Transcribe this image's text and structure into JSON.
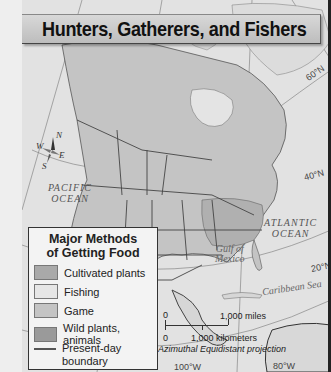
{
  "title": "Hunters, Gatherers, and Fishers",
  "map": {
    "labels": {
      "pacific_ocean": [
        "PACIFIC",
        "OCEAN"
      ],
      "atlantic_ocean": [
        "ATLANTIC",
        "OCEAN"
      ],
      "gulf_of_mexico": [
        "Gulf of",
        "Mexico"
      ],
      "caribbean_sea": "Caribbean Sea"
    },
    "latitudes": [
      "60°N",
      "40°N",
      "20°N"
    ],
    "longitudes": [
      "100°W",
      "80°W"
    ],
    "compass": {
      "n": "N",
      "s": "S",
      "e": "E",
      "w": "W"
    }
  },
  "legend": {
    "title_line1": "Major Methods",
    "title_line2": "of Getting Food",
    "items": [
      {
        "label": "Cultivated plants",
        "color": "#a9a9a9"
      },
      {
        "label": "Fishing",
        "color": "#e6e6e6"
      },
      {
        "label": "Game",
        "color": "#c4c4c4"
      },
      {
        "label": "Wild plants, animals",
        "color": "#9a9a9a"
      }
    ],
    "boundary_label_line1": "Present-day",
    "boundary_label_line2": "boundary"
  },
  "scale": {
    "zero_top": "0",
    "miles": "1,000 miles",
    "zero_bottom": "0",
    "kilometers": "1,000 kilometers",
    "projection": "Azimuthal Equidistant projection"
  }
}
